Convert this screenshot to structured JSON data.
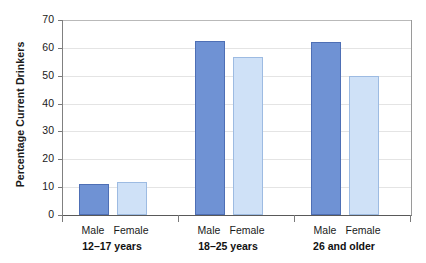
{
  "chart_data": {
    "type": "bar",
    "title": "",
    "subtitle": "",
    "xlabel": "",
    "ylabel": "Percentage Current Drinkers",
    "ylim": [
      0,
      70
    ],
    "ytick_step": 10,
    "yticks": [
      70,
      60,
      50,
      40,
      30,
      20,
      10,
      0
    ],
    "ytick_labels": [
      "70",
      "60",
      "50",
      "40",
      "30",
      "20",
      "10",
      "0"
    ],
    "grid": true,
    "grid_axis": "y",
    "legend": false,
    "legend_position": "none",
    "categories": [
      "12–17 years",
      "18–25 years",
      "26 and older"
    ],
    "series": [
      {
        "name": "Male",
        "color": "#6F92D4",
        "border_color": "#4E6FB5",
        "values": [
          11.2,
          62.3,
          62.1
        ]
      },
      {
        "name": "Female",
        "color": "#CFE1F7",
        "border_color": "#9DBBE2",
        "values": [
          11.9,
          56.8,
          50.0
        ]
      }
    ],
    "group_series_labels": [
      "Male",
      "Female"
    ],
    "annotations": []
  },
  "axis": {
    "y_title": "Percentage Current Drinkers",
    "tick_labels": [
      "70",
      "60",
      "50",
      "40",
      "30",
      "20",
      "10",
      "0"
    ]
  },
  "groups": [
    {
      "label": "12–17 years",
      "bars": [
        {
          "series": "Male",
          "value": 11.2
        },
        {
          "series": "Female",
          "value": 11.9
        }
      ]
    },
    {
      "label": "18–25 years",
      "bars": [
        {
          "series": "Male",
          "value": 62.3
        },
        {
          "series": "Female",
          "value": 56.8
        }
      ]
    },
    {
      "label": "26 and older",
      "bars": [
        {
          "series": "Male",
          "value": 62.1
        },
        {
          "series": "Female",
          "value": 50.0
        }
      ]
    }
  ],
  "series_names": {
    "male": "Male",
    "female": "Female"
  },
  "colors": {
    "male_fill": "#6F92D4",
    "male_border": "#4E6FB5",
    "female_fill": "#CFE1F7",
    "female_border": "#9DBBE2",
    "gridline": "#E4E4E4",
    "axis": "#595959",
    "text": "#1A1A1A"
  }
}
